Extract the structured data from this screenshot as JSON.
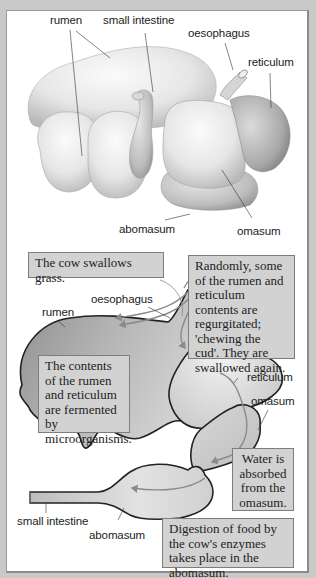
{
  "top_diagram": {
    "title": "External view of cow stomach",
    "labels": {
      "rumen": "rumen",
      "small_intestine": "small intestine",
      "oesophagus": "oesophagus",
      "reticulum": "reticulum",
      "abomasum": "abomasum",
      "omasum": "omasum"
    }
  },
  "bottom_diagram": {
    "title": "Path of food through the stomach",
    "labels": {
      "rumen": "rumen",
      "oesophagus": "oesophagus",
      "reticulum": "reticulum",
      "omasum": "omasum",
      "small_intestine": "small intestine",
      "abomasum": "abomasum"
    },
    "callouts": {
      "swallow": "The cow swallows grass.",
      "regurgitate": "Randomly, some of the rumen and reticulum contents are regurgitated; 'chewing the cud'. They are swallowed again.",
      "ferment": "The contents of the rumen and reticulum are fermented by microorganisms.",
      "water": "Water is absorbed from the omasum.",
      "digestion": "Digestion of food by the cow's enzymes takes place in the abomasum."
    }
  },
  "colors": {
    "background": "#c9c9c9",
    "panel": "#ffffff",
    "callout_fill": "#d2d2d2",
    "rumen_fill": "#a9a9a9",
    "arrow": "#8a8a8a"
  }
}
